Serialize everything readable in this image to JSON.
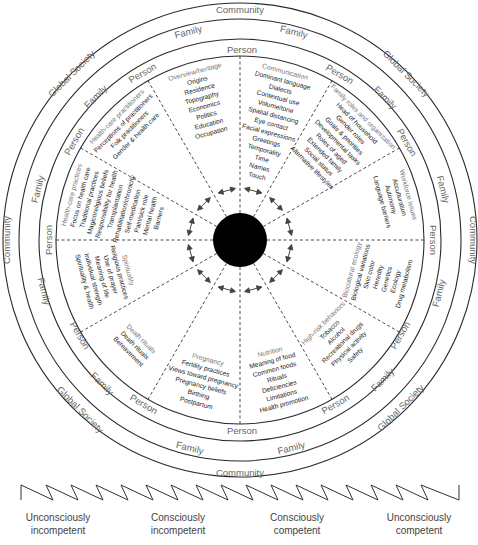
{
  "rings": {
    "outer": "Global Society",
    "community": "Community",
    "family": "Family",
    "person": "Person"
  },
  "domains": [
    {
      "title": "Overview/heritage",
      "items": [
        "Origins",
        "Residence",
        "Topography",
        "Economics",
        "Politics",
        "Education",
        "Occupation"
      ]
    },
    {
      "title": "Communication",
      "items": [
        "Dominant language",
        "Dialects",
        "Contextual use",
        "Volume/tone",
        "Spatial distancing",
        "Eye contact",
        "Facial expressions",
        "Greetings",
        "Temporality",
        "Time",
        "Names",
        "Touch"
      ]
    },
    {
      "title": "Family roles and organization",
      "items": [
        "Head of household",
        "Gender roles",
        "Goals & priorities",
        "Developmental tasks",
        "Roles of aged",
        "Extended family",
        "Social status",
        "Alternative lifestyles"
      ]
    },
    {
      "title": "Workforce issues",
      "items": [
        "Acculturation",
        "Autonomy",
        "Language barriers"
      ]
    },
    {
      "title": "Biocultural ecology",
      "items": [
        "Biological variations",
        "Skin color",
        "Heredity",
        "Genetics",
        "Ecology",
        "Drug metabolism"
      ]
    },
    {
      "title": "High-risk behaviors",
      "items": [
        "Tobacco",
        "Alcohol",
        "Recreational drugs",
        "Physical activity",
        "Safety"
      ]
    },
    {
      "title": "Nutrition",
      "items": [
        "Meaning of food",
        "Common foods",
        "Rituals",
        "Deficiencies",
        "Limitations",
        "Health promotion"
      ]
    },
    {
      "title": "Pregnancy",
      "items": [
        "Fertility practices",
        "Views toward pregnancy",
        "Pregnancy beliefs",
        "Birthing",
        "Postpartum"
      ]
    },
    {
      "title": "Death rituals",
      "items": [
        "Death rituals",
        "Bereavement"
      ]
    },
    {
      "title": "Spirituality",
      "items": [
        "Religious practices",
        "Use of prayer",
        "Meaning of life",
        "Individual strength",
        "Spirituality & health"
      ]
    },
    {
      "title": "Health-care practices",
      "items": [
        "Focus on health care",
        "Traditional practices",
        "Magicoreligious beliefs",
        "Responsibility for health",
        "Transplantation",
        "Rehabilitation/chronicity",
        "Self-medication",
        "Pain/sick role",
        "Mental health",
        "Barriers"
      ]
    },
    {
      "title": "Health-care practitioners",
      "items": [
        "Perceptions of practitioners",
        "Folk practitioners",
        "Gender & health care"
      ]
    }
  ],
  "competence_scale": {
    "stages": [
      {
        "line1": "Unconsciously",
        "line2": "incompetent"
      },
      {
        "line1": "Consciously",
        "line2": "incompetent"
      },
      {
        "line1": "Consciously",
        "line2": "competent"
      },
      {
        "line1": "Unconsciously",
        "line2": "competent"
      }
    ]
  },
  "colors": {
    "line": "#2a2a2a",
    "center": "#000000",
    "label": "#666666"
  }
}
